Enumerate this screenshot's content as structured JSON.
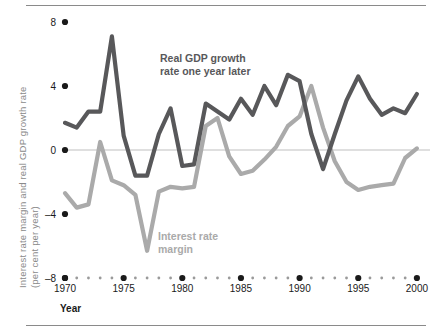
{
  "chart_data": {
    "type": "line",
    "title": "",
    "xlabel": "Year",
    "ylabel": "Interest rate margin and real GDP growth rate (per cent per year)",
    "ylabel_line1": "Interest rate margin and real GDP growth rate",
    "ylabel_line2": "(per cent per year)",
    "xlim": [
      1969,
      2001
    ],
    "ylim": [
      -8,
      8
    ],
    "yticks": [
      8,
      4,
      0,
      -4,
      -8
    ],
    "ytick_labels": [
      "8",
      "4",
      "0",
      "–4",
      "–8"
    ],
    "xticks": [
      1970,
      1975,
      1980,
      1985,
      1990,
      1995,
      2000
    ],
    "xtick_labels": [
      "1970",
      "1975",
      "1980",
      "1985",
      "1990",
      "1995",
      "2000"
    ],
    "minor_xticks": [
      1971,
      1972,
      1973,
      1974,
      1976,
      1977,
      1978,
      1979,
      1981,
      1982,
      1983,
      1984,
      1986,
      1987,
      1988,
      1989,
      1991,
      1992,
      1993,
      1994,
      1996,
      1997,
      1998,
      1999
    ],
    "grid": false,
    "zero_line": true,
    "legend_position": "inline-annotation",
    "x": [
      1970,
      1971,
      1972,
      1973,
      1974,
      1975,
      1976,
      1977,
      1978,
      1979,
      1980,
      1981,
      1982,
      1983,
      1984,
      1985,
      1986,
      1987,
      1988,
      1989,
      1990,
      1991,
      1992,
      1993,
      1994,
      1995,
      1996,
      1997,
      1998,
      1999,
      2000
    ],
    "series": [
      {
        "name": "Real GDP growth rate one year later",
        "color": "#58585a",
        "values": [
          1.7,
          1.4,
          2.4,
          2.4,
          7.1,
          0.9,
          -1.6,
          -1.6,
          1.0,
          2.6,
          -1.0,
          -0.9,
          2.9,
          2.4,
          1.9,
          3.2,
          2.2,
          4.0,
          2.8,
          4.7,
          4.3,
          1.0,
          -1.2,
          1.0,
          3.1,
          4.6,
          3.2,
          2.2,
          2.6,
          2.3,
          3.5
        ]
      },
      {
        "name": "Interest rate margin",
        "color": "#aaaaaa",
        "values": [
          -2.7,
          -3.6,
          -3.4,
          0.5,
          -1.9,
          -2.2,
          -2.8,
          -6.3,
          -2.6,
          -2.3,
          -2.4,
          -2.3,
          1.5,
          2.0,
          -0.4,
          -1.5,
          -1.3,
          -0.6,
          0.2,
          1.5,
          2.1,
          4.0,
          1.4,
          -0.7,
          -2.0,
          -2.5,
          -2.3,
          -2.2,
          -2.1,
          -0.5,
          0.1
        ]
      }
    ],
    "annotations": [
      {
        "name": "gdp-annotation",
        "text_line1": "Real GDP growth",
        "text_line2": "rate one year later",
        "color": "#58585a"
      },
      {
        "name": "margin-annotation",
        "text_line1": "Interest rate",
        "text_line2": "margin",
        "color": "#aaaaaa"
      }
    ],
    "colors": {
      "gdp_line": "#58585a",
      "margin_line": "#aaaaaa",
      "axis_text": "#8a8a8a",
      "tick_dot": "#1a1a1a",
      "zero_line": "#bfbfbf",
      "rule": "#8a8a8a",
      "xlabel_text": "#1a1a1a"
    }
  }
}
